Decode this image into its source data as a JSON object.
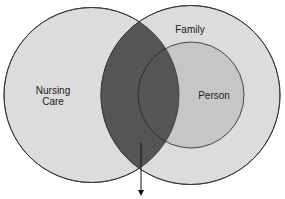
{
  "diagram": {
    "type": "venn",
    "circles": [
      {
        "id": "nursing-care",
        "label_lines": [
          "Nursing",
          "Care"
        ],
        "fill": "#dcdcdc"
      },
      {
        "id": "family",
        "label": "Family",
        "fill": "#dcdcdc"
      },
      {
        "id": "person",
        "label": "Person",
        "fill": "#c4c4c4"
      }
    ],
    "intersection": {
      "fill": "#555555"
    },
    "labels": {
      "nursing_line1": "Nursing",
      "nursing_line2": "Care",
      "family": "Family",
      "person": "Person"
    },
    "colors": {
      "outline": "#333333",
      "background": "#ffffff"
    }
  }
}
